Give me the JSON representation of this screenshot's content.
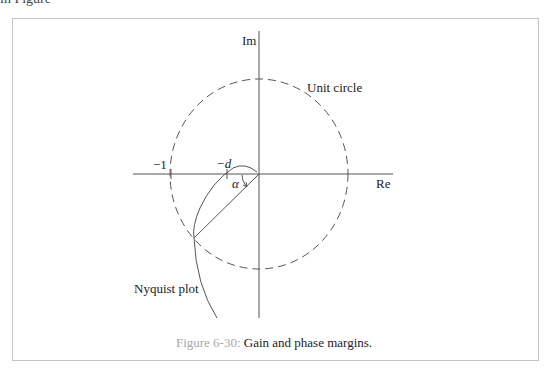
{
  "page": {
    "top_fragment": "in Figure",
    "caption": {
      "number": "Figure 6-30:",
      "text": " Gain and phase margins."
    }
  },
  "diagram": {
    "labels": {
      "im_axis": "Im",
      "re_axis": "Re",
      "unit_circle": "Unit circle",
      "minus_one": "−1",
      "minus_d": "−d",
      "alpha": "α",
      "nyquist": "Nyquist plot"
    },
    "colors": {
      "line": "#555555",
      "frame": "#c4c4c4",
      "caption_number": "#a8a8a8"
    }
  }
}
